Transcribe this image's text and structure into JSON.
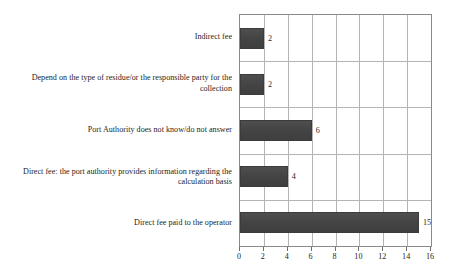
{
  "chart_data": {
    "type": "bar",
    "orientation": "horizontal",
    "title": "",
    "subtitle": "",
    "xlabel": "",
    "ylabel": "",
    "xlim": [
      0,
      16
    ],
    "xticks": [
      0,
      2,
      4,
      6,
      8,
      10,
      12,
      14,
      16
    ],
    "xtick_labels": [
      "0",
      "2",
      "4",
      "6",
      "8",
      "10",
      "12",
      "14",
      "16"
    ],
    "grid": true,
    "grid_axis": "both",
    "legend": false,
    "legend_position": "none",
    "bar_color": "#474747",
    "grid_color": "#b4b4b4",
    "axis_color": "#8a8a8a",
    "categories": [
      "Indirect fee",
      "Depend on the type of residue/or the responsible party for the collection",
      "Port Authority does not know/do not answer",
      "Direct fee: the port authority provides information regarding the calculation basis",
      "Direct fee paid to the operator"
    ],
    "values": [
      2,
      2,
      6,
      4,
      15
    ],
    "data_labels": [
      "2",
      "2",
      "6",
      "4",
      "15"
    ],
    "points": [
      {
        "category": "Indirect fee",
        "value": 2,
        "label": "2"
      },
      {
        "category": "Depend on the type of residue/or the responsible party for the collection",
        "value": 2,
        "label": "2"
      },
      {
        "category": "Port Authority does not know/do not answer",
        "value": 6,
        "label": "6"
      },
      {
        "category": "Direct fee: the port authority provides information regarding the calculation basis",
        "value": 4,
        "label": "4"
      },
      {
        "category": "Direct fee paid to the operator",
        "value": 15,
        "label": "15"
      }
    ]
  }
}
